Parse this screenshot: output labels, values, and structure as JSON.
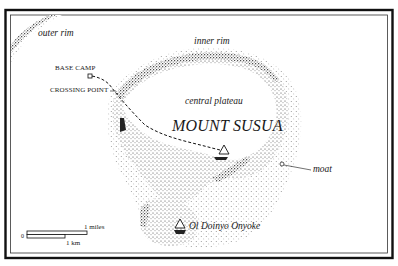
{
  "map": {
    "title": "MOUNT SUSUA",
    "labels": {
      "outer_rim": "outer rim",
      "inner_rim": "inner rim",
      "central_plateau": "central plateau",
      "base_camp": "BASE CAMP",
      "crossing_point": "CROSSING POINT",
      "moat": "moat",
      "peak": "Ol Doinyo Onyoke"
    },
    "scale_bar": {
      "zero": "0",
      "miles": "1 miles",
      "km": "1 km"
    },
    "colors": {
      "ink": "#1a1a1a",
      "paper": "#ffffff"
    }
  }
}
